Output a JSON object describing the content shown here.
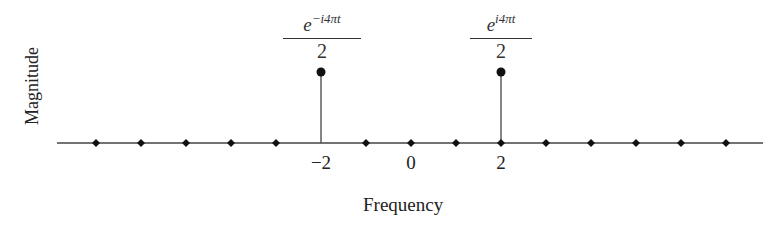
{
  "chart_data": {
    "type": "stem",
    "title": "",
    "xlabel": "Frequency",
    "ylabel": "Magnitude",
    "x": [
      -7,
      -6,
      -5,
      -4,
      -3,
      -2,
      -1,
      0,
      1,
      2,
      3,
      4,
      5,
      6,
      7
    ],
    "values": [
      0,
      0,
      0,
      0,
      0,
      0.5,
      0,
      0,
      0,
      0.5,
      0,
      0,
      0,
      0,
      0
    ],
    "tick_labels": [
      {
        "x": -2,
        "label": "−2"
      },
      {
        "x": 0,
        "label": "0"
      },
      {
        "x": 2,
        "label": "2"
      }
    ],
    "annotations": [
      {
        "x": -2,
        "numerator_base": "e",
        "numerator_exp": "−i4πt",
        "denominator": "2"
      },
      {
        "x": 2,
        "numerator_base": "e",
        "numerator_exp": "i4πt",
        "denominator": "2"
      }
    ],
    "grid": false,
    "legend": null
  }
}
